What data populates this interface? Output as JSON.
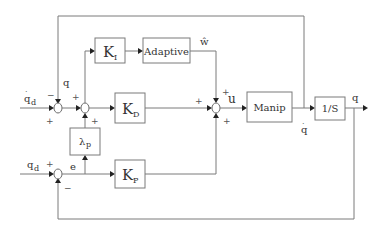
{
  "diagram": {
    "type": "control-block-diagram",
    "blocks": {
      "ki": {
        "main": "K",
        "sub": "I"
      },
      "adaptive": {
        "label": "Adaptive"
      },
      "kd": {
        "main": "K",
        "sub": "D"
      },
      "lambda_p": {
        "main": "λ",
        "sub": "p"
      },
      "kp": {
        "main": "K",
        "sub": "P"
      },
      "manip": {
        "label": "Manip"
      },
      "integrator": {
        "label": "1/S"
      }
    },
    "signals": {
      "qd_dot": {
        "main": "q",
        "sub": "d",
        "dot": "·"
      },
      "qd": {
        "main": "q",
        "sub": "d"
      },
      "q_fb": "q",
      "e": "e",
      "w_hat": "ŵ",
      "u": "u",
      "q_dot": {
        "main": "q",
        "dot": "·"
      },
      "q_out": "q"
    },
    "signs": {
      "sum1_top": "−",
      "sum1_left": "+",
      "sum2_left": "+",
      "sum2_bottom": "+",
      "sum3_left": "+",
      "sum3_top": "+",
      "sum3_bottom": "+",
      "sum4_left": "+",
      "sum4_bottom": "−"
    }
  }
}
